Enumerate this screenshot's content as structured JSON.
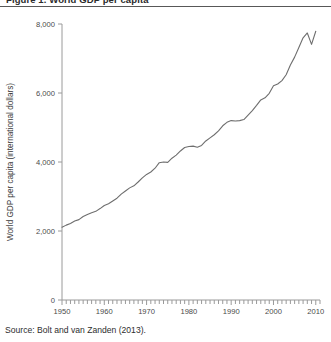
{
  "figure": {
    "title": "Figure 1.  World GDP per capita",
    "source_note": "Source: Bolt and van Zanden (2013)."
  },
  "chart_data": {
    "type": "line",
    "title": "World GDP per capita",
    "xlabel": "",
    "ylabel": "World GDP per capita (international dollars)",
    "xlim": [
      1950,
      2011
    ],
    "ylim": [
      0,
      8000
    ],
    "grid": false,
    "legend": null,
    "line_color": "#6e6e6e",
    "x_major_ticks": [
      1950,
      1960,
      1970,
      1980,
      1990,
      2000,
      2010
    ],
    "x_major_tick_labels": [
      "1950",
      "1960",
      "1970",
      "1980",
      "1990",
      "2000",
      "2010"
    ],
    "x_minor_tick_step": 1,
    "y_ticks": [
      0,
      2000,
      4000,
      6000,
      8000
    ],
    "y_tick_labels": [
      "0",
      "2,000",
      "4,000",
      "6,000",
      "8,000"
    ],
    "x": [
      1950,
      1951,
      1952,
      1953,
      1954,
      1955,
      1956,
      1957,
      1958,
      1959,
      1960,
      1961,
      1962,
      1963,
      1964,
      1965,
      1966,
      1967,
      1968,
      1969,
      1970,
      1971,
      1972,
      1973,
      1974,
      1975,
      1976,
      1977,
      1978,
      1979,
      1980,
      1981,
      1982,
      1983,
      1984,
      1985,
      1986,
      1987,
      1988,
      1989,
      1990,
      1991,
      1992,
      1993,
      1994,
      1995,
      1996,
      1997,
      1998,
      1999,
      2000,
      2001,
      2002,
      2003,
      2004,
      2005,
      2006,
      2007,
      2008,
      2009,
      2010
    ],
    "values": [
      2110,
      2170,
      2220,
      2290,
      2330,
      2420,
      2480,
      2530,
      2570,
      2650,
      2740,
      2790,
      2870,
      2950,
      3070,
      3160,
      3250,
      3310,
      3420,
      3540,
      3640,
      3710,
      3820,
      3980,
      4000,
      3990,
      4110,
      4200,
      4320,
      4420,
      4450,
      4460,
      4430,
      4480,
      4610,
      4700,
      4790,
      4900,
      5050,
      5150,
      5200,
      5190,
      5200,
      5230,
      5360,
      5490,
      5640,
      5800,
      5860,
      5990,
      6210,
      6260,
      6360,
      6530,
      6810,
      7040,
      7320,
      7600,
      7740,
      7410,
      7790
    ]
  }
}
